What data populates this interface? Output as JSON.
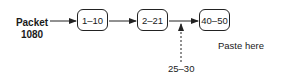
{
  "diagram": {
    "source": {
      "line1": "Packet",
      "line2": "1080"
    },
    "nodes": [
      {
        "id": "node-1",
        "label": "1–10"
      },
      {
        "id": "node-2",
        "label": "2–21"
      },
      {
        "id": "node-3",
        "label": "40–50"
      }
    ],
    "insert": {
      "label": "25–30"
    },
    "annotation": "Paste here",
    "colors": {
      "stroke": "#222222",
      "text": "#1a1a1a",
      "background": "#ffffff"
    }
  }
}
